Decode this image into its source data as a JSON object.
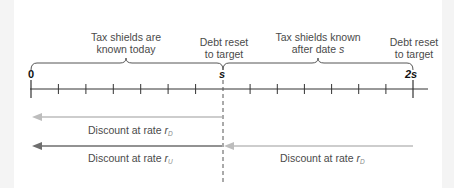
{
  "diagram": {
    "annotations": {
      "left_brace": "Tax shields are known today",
      "left_brace_line1": "Tax shields are",
      "left_brace_line2": "known today",
      "mid_reset_line1": "Debt reset",
      "mid_reset_line2": "to target",
      "right_brace_line1": "Tax shields known",
      "right_brace_line2_prefix": "after date ",
      "right_brace_line2_var": "s",
      "end_reset_line1": "Debt reset",
      "end_reset_line2": "to target"
    },
    "timeline": {
      "labels": [
        "0",
        "s",
        "2s"
      ],
      "ticks_per_period": 7,
      "label_zero": "0",
      "label_s": "s",
      "label_2s": "2s"
    },
    "arrows": [
      {
        "from": "s",
        "to": "0",
        "prefix": "Discount at rate ",
        "rate": "r",
        "subscript": "D",
        "color": "#bdbdbd"
      },
      {
        "from": "s",
        "to": "0",
        "prefix": "Discount at rate ",
        "rate": "r",
        "subscript": "U",
        "color": "#6e6e6e"
      },
      {
        "from": "2s",
        "to": "s",
        "prefix": "Discount at rate ",
        "rate": "r",
        "subscript": "D",
        "color": "#bdbdbd"
      }
    ],
    "colors": {
      "axis": "#333333",
      "light_arrow": "#bdbdbd",
      "dark_arrow": "#6e6e6e",
      "dashed": "#555555"
    }
  }
}
